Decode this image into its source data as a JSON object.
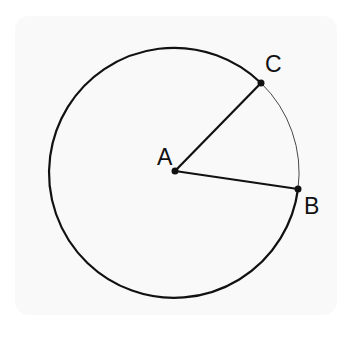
{
  "diagram": {
    "type": "circle-with-radii",
    "points": [
      {
        "id": "A",
        "label": "A",
        "role": "center",
        "x": 175,
        "y": 171
      },
      {
        "id": "B",
        "label": "B",
        "role": "on-circle",
        "x": 298,
        "y": 189
      },
      {
        "id": "C",
        "label": "C",
        "role": "on-circle",
        "x": 261,
        "y": 83
      }
    ],
    "segments": [
      {
        "from": "A",
        "to": "C"
      },
      {
        "from": "A",
        "to": "B"
      }
    ],
    "circle": {
      "center": "A",
      "radius": 125,
      "minor_arc_BC_style": "thin",
      "major_arc_style": "thick"
    },
    "colors": {
      "stroke": "#111111",
      "card": "#f9f9f9",
      "background": "#ffffff"
    }
  }
}
